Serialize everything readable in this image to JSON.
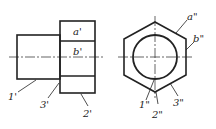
{
  "diagram": {
    "front_view": {
      "labels": {
        "a": "a'",
        "b": "b'",
        "p1": "1'",
        "p2": "2'",
        "p3": "3'"
      }
    },
    "side_view": {
      "labels": {
        "a": "a\"",
        "b": "b\"",
        "p1": "1\"",
        "p2": "2\"",
        "p3": "3\""
      }
    },
    "colors": {
      "line": "#222222",
      "background": "#ffffff"
    }
  }
}
